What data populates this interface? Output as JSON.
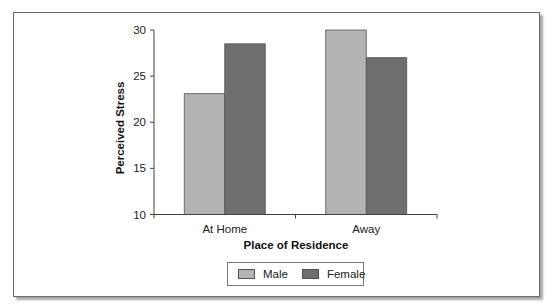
{
  "chart_data": {
    "type": "bar",
    "title": "",
    "xlabel": "Place of Residence",
    "ylabel": "Perceived Stress",
    "categories": [
      "At Home",
      "Away"
    ],
    "series": [
      {
        "name": "Male",
        "values": [
          23.1,
          30.0
        ],
        "color": "#b3b3b3"
      },
      {
        "name": "Female",
        "values": [
          28.5,
          27.0
        ],
        "color": "#6e6e6e"
      }
    ],
    "ylim": [
      10,
      30
    ],
    "yticks": [
      10,
      15,
      20,
      25,
      30
    ],
    "grid": false,
    "legend_position": "bottom"
  },
  "legend": {
    "items": [
      {
        "label": "Male",
        "color": "#b3b3b3"
      },
      {
        "label": "Female",
        "color": "#6e6e6e"
      }
    ]
  }
}
